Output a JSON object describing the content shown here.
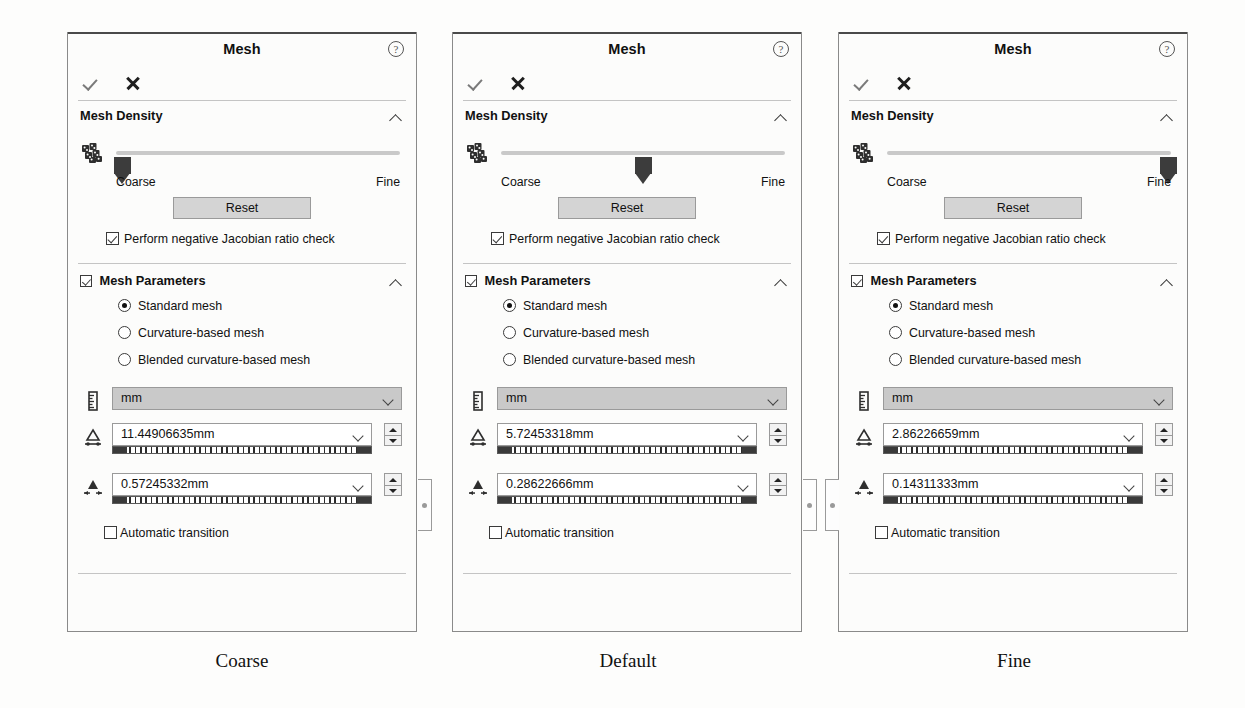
{
  "page": {
    "background": "#fdfdfc",
    "caption_font_color": "#111111"
  },
  "common": {
    "title": "Mesh",
    "help_icon": "help-circle-icon",
    "ok_icon": "checkmark-icon",
    "cancel_icon": "close-x-icon",
    "mesh_density": {
      "header": "Mesh Density",
      "collapse_icon": "chevron-up-icon",
      "density_icon": "mesh-cubes-icon",
      "coarse_label": "Coarse",
      "fine_label": "Fine",
      "reset_label": "Reset",
      "jacobian_label": "Perform negative Jacobian ratio check",
      "jacobian_checked": true
    },
    "mesh_parameters": {
      "header": "Mesh Parameters",
      "header_checked": true,
      "collapse_icon": "chevron-up-icon",
      "options": [
        {
          "label": "Standard mesh",
          "selected": true
        },
        {
          "label": "Curvature-based mesh",
          "selected": false
        },
        {
          "label": "Blended curvature-based mesh",
          "selected": false
        }
      ],
      "units_icon": "ruler-icon",
      "units_value": "mm",
      "element_size_icon": "global-element-size-icon",
      "tolerance_icon": "mesh-tolerance-icon",
      "dropdown_icon": "chevron-down-icon",
      "spinner_up_icon": "spinner-up-icon",
      "spinner_down_icon": "spinner-down-icon",
      "automatic_transition_label": "Automatic transition",
      "automatic_transition_checked": false
    },
    "colors": {
      "panel_bg": "#fcfcfb",
      "panel_border": "#8a8a8a",
      "combo_disabled_bg": "#c9c9c9",
      "button_bg": "#d4d4d4",
      "slider_track": "#c9c9c9",
      "slider_thumb": "#3c3c3c"
    }
  },
  "panels": [
    {
      "id": "coarse",
      "caption": "Coarse",
      "density_percent": 2,
      "element_size": "11.44906635mm",
      "tolerance": "0.57245332mm"
    },
    {
      "id": "default",
      "caption": "Default",
      "density_percent": 50,
      "element_size": "5.72453318mm",
      "tolerance": "0.28622666mm"
    },
    {
      "id": "fine",
      "caption": "Fine",
      "density_percent": 99,
      "element_size": "2.86226659mm",
      "tolerance": "0.14311333mm"
    }
  ]
}
